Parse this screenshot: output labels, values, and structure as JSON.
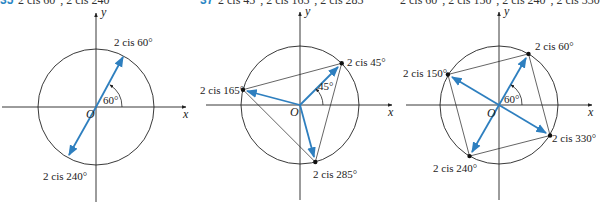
{
  "colors": {
    "vector": "#2e7fbf",
    "circle": "#222222",
    "axis": "#222222",
    "background": "#ffffff"
  },
  "top_strip": {
    "panel1": {
      "number": "35",
      "text": "2 cis 60°, 2 cis 240°"
    },
    "panel2": {
      "number": "37",
      "text": "2 cis 45°, 2 cis 165°, 2 cis 285°"
    },
    "panel3": {
      "number": "",
      "text": "2 cis 60°, 2 cis 150°, 2 cis 240°, 2 cis 330°"
    }
  },
  "panels": [
    {
      "axis_x": "x",
      "axis_y": "y",
      "origin": "O",
      "angle_label": "60°",
      "points": [
        {
          "label": "2 cis 60°",
          "angle": 60
        },
        {
          "label": "2 cis 240°",
          "angle": 240
        }
      ]
    },
    {
      "axis_x": "x",
      "axis_y": "y",
      "origin": "O",
      "angle_label": "45°",
      "points": [
        {
          "label": "2 cis 45°",
          "angle": 45
        },
        {
          "label": "2 cis 165°",
          "angle": 165
        },
        {
          "label": "2 cis 285°",
          "angle": 285
        }
      ]
    },
    {
      "axis_x": "x",
      "axis_y": "y",
      "origin": "O",
      "angle_label": "60°",
      "points": [
        {
          "label": "2 cis 60°",
          "angle": 60
        },
        {
          "label": "2 cis 150°",
          "angle": 150
        },
        {
          "label": "2 cis 240°",
          "angle": 240
        },
        {
          "label": "2 cis 330°",
          "angle": 330
        }
      ]
    }
  ]
}
